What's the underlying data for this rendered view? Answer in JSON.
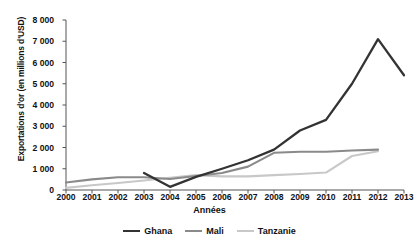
{
  "chart_data": {
    "type": "line",
    "title": "",
    "xlabel": "Années",
    "ylabel": "Exportations d'or (en millions d'USD)",
    "x": [
      2000,
      2001,
      2002,
      2003,
      2004,
      2005,
      2006,
      2007,
      2008,
      2009,
      2010,
      2011,
      2012,
      2013
    ],
    "xtick_labels": [
      "2000",
      "2001",
      "2002",
      "2003",
      "2004",
      "2005",
      "2006",
      "2007",
      "2008",
      "2009",
      "2010",
      "2011",
      "2012",
      "2013"
    ],
    "ytick_labels": [
      "0",
      "1 000",
      "2 000",
      "3 000",
      "4 000",
      "5 000",
      "6 000",
      "7 000",
      "8 000"
    ],
    "ytick_values": [
      0,
      1000,
      2000,
      3000,
      4000,
      5000,
      6000,
      7000,
      8000
    ],
    "ylim": [
      0,
      8000
    ],
    "xlim": [
      2000,
      2013
    ],
    "grid": false,
    "legend_position": "bottom-center",
    "series": [
      {
        "name": "Ghana",
        "color": "#333333",
        "x": [
          2003,
          2004,
          2005,
          2006,
          2007,
          2008,
          2009,
          2010,
          2011,
          2012,
          2013
        ],
        "values": [
          800,
          150,
          620,
          1000,
          1400,
          1900,
          2800,
          3300,
          5000,
          7100,
          5400
        ]
      },
      {
        "name": "Mali",
        "color": "#8a8a8a",
        "x": [
          2000,
          2001,
          2002,
          2003,
          2004,
          2005,
          2006,
          2007,
          2008,
          2009,
          2010,
          2011,
          2012
        ],
        "values": [
          350,
          500,
          600,
          600,
          520,
          660,
          800,
          1100,
          1750,
          1800,
          1800,
          1860,
          1900
        ]
      },
      {
        "name": "Tanzanie",
        "color": "#c8c8c8",
        "x": [
          2000,
          2001,
          2002,
          2003,
          2004,
          2005,
          2006,
          2007,
          2008,
          2009,
          2010,
          2011,
          2012
        ],
        "values": [
          100,
          220,
          330,
          450,
          580,
          700,
          640,
          640,
          700,
          750,
          820,
          1600,
          1820
        ]
      }
    ]
  },
  "legend": {
    "items": [
      {
        "label": "Ghana",
        "color": "#333333"
      },
      {
        "label": "Mali",
        "color": "#8a8a8a"
      },
      {
        "label": "Tanzanie",
        "color": "#c8c8c8"
      }
    ]
  }
}
